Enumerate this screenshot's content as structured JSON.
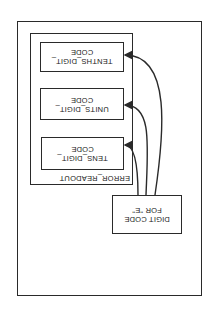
{
  "diagram": {
    "orientation": "rotated-180",
    "container": {
      "label": ""
    },
    "group": {
      "label": "ERROR_READOUT"
    },
    "boxes": [
      {
        "id": "tenths",
        "line1": "TENTHS_DIGIT_",
        "line2": "CODE"
      },
      {
        "id": "units",
        "line1": "UNITS_DIGIT_",
        "line2": "CODE"
      },
      {
        "id": "tens",
        "line1": "TENS_DIGIT_",
        "line2": "CODE"
      }
    ],
    "source": {
      "line1": "DIGIT CODE",
      "line2": "FOR \"E\""
    },
    "edges": [
      {
        "from": "DIGIT CODE FOR \"E\"",
        "to": "TENTHS_DIGIT_CODE"
      },
      {
        "from": "DIGIT CODE FOR \"E\"",
        "to": "UNITS_DIGIT_CODE"
      },
      {
        "from": "DIGIT CODE FOR \"E\"",
        "to": "TENS_DIGIT_CODE"
      }
    ],
    "colors": {
      "line": "#2a2a2a",
      "background": "#ffffff"
    }
  }
}
